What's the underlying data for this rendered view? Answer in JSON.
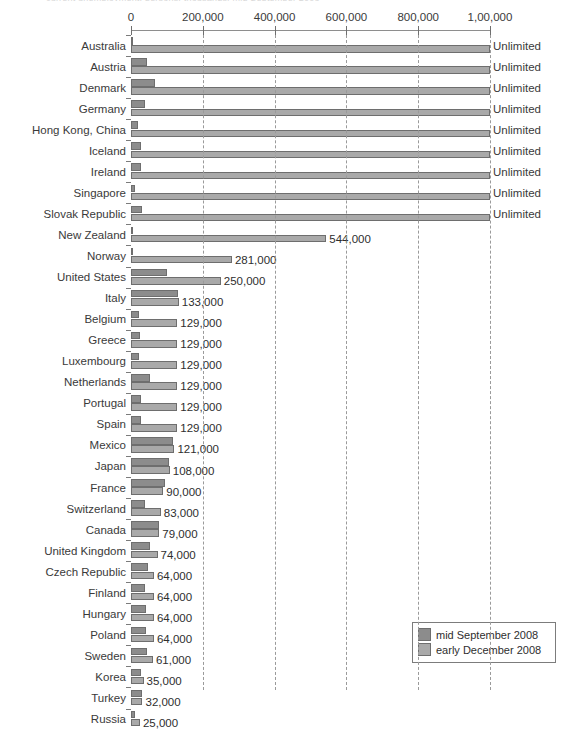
{
  "title_fragment": "current unemployment, persons, thousands; mid September 2008",
  "legend": {
    "position": "bottom-right",
    "items": [
      {
        "label": "mid September 2008",
        "color": "#8c8c8c",
        "key": "sep"
      },
      {
        "label": "early December 2008",
        "color": "#a9a9a9",
        "key": "dec"
      }
    ]
  },
  "axis": {
    "tick_labels": [
      "0",
      "200,000",
      "400,000",
      "600,000",
      "800,000",
      "1,00,000"
    ],
    "tick_values": [
      0,
      200000,
      400000,
      600000,
      800000,
      1000000
    ],
    "unlimited_text": "Unlimited"
  },
  "chart_data": {
    "type": "bar",
    "orientation": "horizontal",
    "title": "current unemployment, persons, thousands; mid September 2008",
    "xlabel": "",
    "ylabel": "",
    "xlim": [
      0,
      1000000
    ],
    "grid": true,
    "grid_style": "dashed vertical",
    "legend_position": "bottom-right",
    "categories": [
      "Australia",
      "Austria",
      "Denmark",
      "Germany",
      "Hong Kong, China",
      "Iceland",
      "Ireland",
      "Singapore",
      "Slovak Republic",
      "New Zealand",
      "Norway",
      "United States",
      "Italy",
      "Belgium",
      "Greece",
      "Luxembourg",
      "Netherlands",
      "Portugal",
      "Spain",
      "Mexico",
      "Japan",
      "France",
      "Switzerland",
      "Canada",
      "United Kingdom",
      "Czech Republic",
      "Finland",
      "Hungary",
      "Poland",
      "Sweden",
      "Korea",
      "Turkey",
      "Russia"
    ],
    "series": [
      {
        "name": "mid September 2008",
        "color": "#8c8c8c",
        "values": [
          2000,
          44000,
          66000,
          40000,
          20000,
          28000,
          28000,
          12000,
          30000,
          3000,
          3000,
          100000,
          130000,
          23000,
          25000,
          22000,
          53000,
          28000,
          27000,
          118000,
          105000,
          95000,
          40000,
          77000,
          52000,
          48000,
          38000,
          43000,
          42000,
          45000,
          28000,
          30000,
          11000
        ]
      },
      {
        "name": "early December 2008",
        "color": "#a9a9a9",
        "values": [
          1000000,
          1000000,
          1000000,
          1000000,
          1000000,
          1000000,
          1000000,
          1000000,
          1000000,
          544000,
          281000,
          250000,
          133000,
          129000,
          129000,
          129000,
          129000,
          129000,
          129000,
          121000,
          108000,
          90000,
          83000,
          79000,
          74000,
          64000,
          64000,
          64000,
          64000,
          61000,
          35000,
          32000,
          25000
        ]
      }
    ],
    "value_labels": [
      "Unlimited",
      "Unlimited",
      "Unlimited",
      "Unlimited",
      "Unlimited",
      "Unlimited",
      "Unlimited",
      "Unlimited",
      "Unlimited",
      "544,000",
      "281,000",
      "250,000",
      "133,000",
      "129,000",
      "129,000",
      "129,000",
      "129,000",
      "129,000",
      "129,000",
      "121,000",
      "108,000",
      "90,000",
      "83,000",
      "79,000",
      "74,000",
      "64,000",
      "64,000",
      "64,000",
      "64,000",
      "61,000",
      "35,000",
      "32,000",
      "25,000"
    ],
    "unlimited_flags": [
      true,
      true,
      true,
      true,
      true,
      true,
      true,
      true,
      true,
      false,
      false,
      false,
      false,
      false,
      false,
      false,
      false,
      false,
      false,
      false,
      false,
      false,
      false,
      false,
      false,
      false,
      false,
      false,
      false,
      false,
      false,
      false,
      false
    ]
  }
}
